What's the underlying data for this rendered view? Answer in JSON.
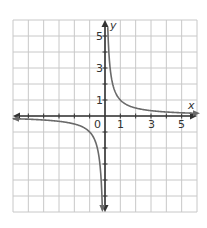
{
  "chart_data": {
    "type": "line",
    "title": "",
    "function": "y = 1/x",
    "xlabel": "x",
    "ylabel": "y",
    "xlim": [
      -6,
      6
    ],
    "ylim": [
      -6,
      6
    ],
    "grid": true,
    "x_tick_labels": [
      "1",
      "3",
      "5"
    ],
    "y_tick_labels": [
      "1",
      "3",
      "5"
    ],
    "origin_label": "0",
    "series": [
      {
        "name": "branch-positive",
        "x": [
          0.18,
          0.2,
          0.25,
          0.33,
          0.5,
          0.75,
          1,
          1.5,
          2,
          3,
          4,
          5,
          6
        ],
        "y": [
          5.6,
          5,
          4,
          3,
          2,
          1.33,
          1,
          0.67,
          0.5,
          0.33,
          0.25,
          0.2,
          0.17
        ]
      },
      {
        "name": "branch-negative",
        "x": [
          -6,
          -5,
          -4,
          -3,
          -2,
          -1.5,
          -1,
          -0.75,
          -0.5,
          -0.33,
          -0.25,
          -0.2,
          -0.17
        ],
        "y": [
          -0.17,
          -0.2,
          -0.25,
          -0.33,
          -0.5,
          -0.67,
          -1,
          -1.33,
          -2,
          -3,
          -4,
          -5,
          -5.9
        ]
      }
    ],
    "colors": {
      "grid": "#c8c8c8",
      "axis": "#333333",
      "curve": "#6a6a6a"
    }
  }
}
